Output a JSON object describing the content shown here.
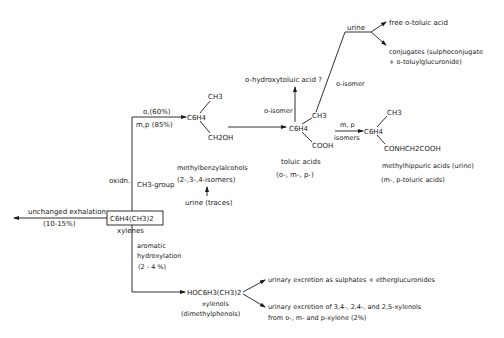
{
  "diagram": {
    "type": "metabolic-pathway",
    "nodes": {
      "xylenes": {
        "formula": "C6H4(CH3)2",
        "label": "xylenes"
      },
      "exhalation": {
        "label": "unchanged exhalation",
        "percent": "(10-15%)"
      },
      "oxidation": {
        "label": "oxidn.",
        "group": "CH3-group",
        "o_branch": "o,(60%)",
        "mp_branch": "m,p (85%)"
      },
      "benzyl_alcohols": {
        "formula_ring": "C6H4",
        "substituent_top": "CH3",
        "substituent_bottom": "CH2OH",
        "label": "methylbenzylalcohols",
        "isomers": "(2-,3-,4-isomers)"
      },
      "urine_traces": {
        "label": "urine (traces)"
      },
      "toluic_acids": {
        "formula_ring": "C6H4",
        "substituent_top": "CH3",
        "substituent_bottom": "COOH",
        "label": "toluic acids",
        "isomers": "(o-, m-, p-)"
      },
      "hydroxytoluic": {
        "label": "o-hydroxytoluic acid ?",
        "edge_label": "o-isomer"
      },
      "o_isomer_urine": {
        "edge_label": "o-isomer",
        "urine": "urine"
      },
      "free_toluic": {
        "label": "free o-toluic acid"
      },
      "conjugates": {
        "line1": "conjugates (sulphoconjugate",
        "line2": "+ o-toluylglucuronide)"
      },
      "methylhippuric": {
        "edge_top": "m, p",
        "edge_bottom": "isomers",
        "formula_ring": "C6H4",
        "substituent_top": "CH3",
        "substituent_bottom": "CONHCH2COOH",
        "label": "methylhippuric acids (urine)",
        "sublabel": "(m-, p-toluric acids)"
      },
      "hydroxylation": {
        "line1": "aromatic",
        "line2": "hydroxylation",
        "line3": "(2 - 4 %)"
      },
      "xylenols": {
        "formula": "HOC6H3(CH3)2",
        "label": "xylenols",
        "sublabel": "(dimethylphenols)"
      },
      "sulphates": {
        "label": "urinary excretion as sulphates + etherglucuronides"
      },
      "xylenol_excretion": {
        "line1": "urinary excretion of 3,4-, 2,4-, and 2,5-xylenols",
        "line2": "from o-, m- and p-xylene (2%)"
      }
    }
  }
}
